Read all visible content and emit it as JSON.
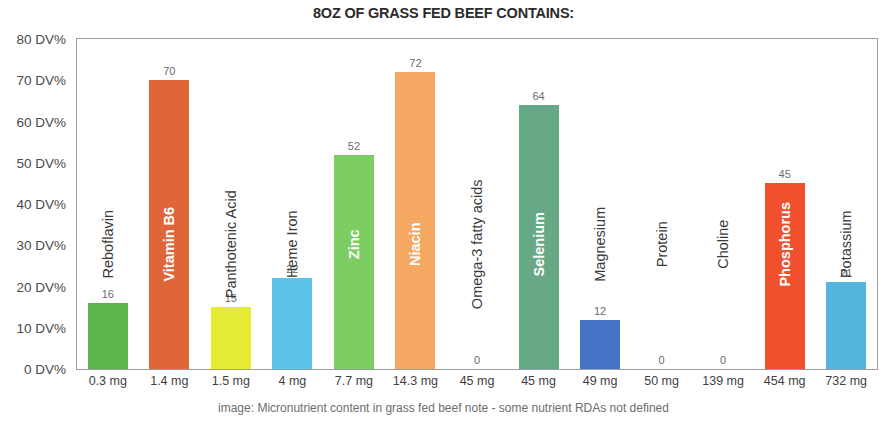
{
  "chart_data": {
    "type": "bar",
    "title": "8OZ OF GRASS FED BEEF CONTAINS:",
    "xlabel": "",
    "ylabel": "",
    "ylim": [
      0,
      80
    ],
    "grid": false,
    "legend": "none",
    "y_ticks": [
      "0 DV%",
      "10 DV%",
      "20 DV%",
      "30 DV%",
      "40 DV%",
      "50 DV%",
      "60 DV%",
      "70 DV%",
      "80 DV%"
    ],
    "y_tick_values": [
      0,
      10,
      20,
      30,
      40,
      50,
      60,
      70,
      80
    ],
    "categories": [
      "Reboflavin",
      "Vitamin B6",
      "Panthotenic Acid",
      "Heme Iron",
      "Zinc",
      "Niacin",
      "Omega-3 fatty acids",
      "Selenium",
      "Magnesium",
      "Protein",
      "Choline",
      "Phosphorus",
      "Potassium"
    ],
    "values": [
      16,
      70,
      15,
      22,
      52,
      72,
      0,
      64,
      12,
      0,
      0,
      45,
      21
    ],
    "x_tick_labels": [
      "0.3 mg",
      "1.4 mg",
      "1.5 mg",
      "4 mg",
      "7.7 mg",
      "14.3 mg",
      "45 mg",
      "45 mg",
      "49 mg",
      "50 mg",
      "139 mg",
      "454 mg",
      "732 mg"
    ],
    "colors": [
      "#5CB44B",
      "#E0663A",
      "#E6EB36",
      "#5BC4E8",
      "#7DCE62",
      "#F4A862",
      "#F4A862",
      "#67A986",
      "#4472C4",
      "#4472C4",
      "#4472C4",
      "#F1502F",
      "#54B4DE"
    ],
    "label_on_bar": [
      false,
      true,
      false,
      false,
      true,
      true,
      false,
      true,
      false,
      false,
      false,
      true,
      false
    ],
    "bars": [
      {
        "name": "Reboflavin",
        "value": 16,
        "value_label": "16",
        "x_label": "0.3 mg",
        "color": "#5CB44B",
        "label_on_bar": false
      },
      {
        "name": "Vitamin B6",
        "value": 70,
        "value_label": "70",
        "x_label": "1.4 mg",
        "color": "#E0663A",
        "label_on_bar": true
      },
      {
        "name": "Panthotenic Acid",
        "value": 15,
        "value_label": "15",
        "x_label": "1.5 mg",
        "color": "#E6EB36",
        "label_on_bar": false
      },
      {
        "name": "Heme Iron",
        "value": 22,
        "value_label": "22",
        "x_label": "4 mg",
        "color": "#5BC4E8",
        "label_on_bar": false
      },
      {
        "name": "Zinc",
        "value": 52,
        "value_label": "52",
        "x_label": "7.7 mg",
        "color": "#7DCE62",
        "label_on_bar": true
      },
      {
        "name": "Niacin",
        "value": 72,
        "value_label": "72",
        "x_label": "14.3 mg",
        "color": "#F4A862",
        "label_on_bar": true
      },
      {
        "name": "Omega-3 fatty acids",
        "value": 0,
        "value_label": "0",
        "x_label": "45 mg",
        "color": "#F4A862",
        "label_on_bar": false
      },
      {
        "name": "Selenium",
        "value": 64,
        "value_label": "64",
        "x_label": "45 mg",
        "color": "#67A986",
        "label_on_bar": true
      },
      {
        "name": "Magnesium",
        "value": 12,
        "value_label": "12",
        "x_label": "49 mg",
        "color": "#4472C4",
        "label_on_bar": false
      },
      {
        "name": "Protein",
        "value": 0,
        "value_label": "0",
        "x_label": "50 mg",
        "color": "#4472C4",
        "label_on_bar": false
      },
      {
        "name": "Choline",
        "value": 0,
        "value_label": "0",
        "x_label": "139 mg",
        "color": "#4472C4",
        "label_on_bar": false
      },
      {
        "name": "Phosphorus",
        "value": 45,
        "value_label": "45",
        "x_label": "454 mg",
        "color": "#F1502F",
        "label_on_bar": true
      },
      {
        "name": "Potassium",
        "value": 21,
        "value_label": "21",
        "x_label": "732 mg",
        "color": "#54B4DE",
        "label_on_bar": false
      }
    ]
  },
  "caption": "image: Micronutrient content in grass fed beef  note - some nutrient RDAs not defined"
}
